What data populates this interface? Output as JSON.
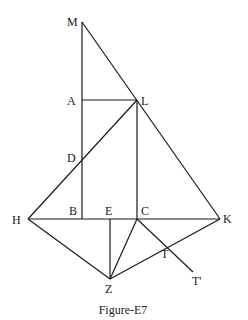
{
  "figure": {
    "caption": "Figure-E7",
    "points": {
      "M": {
        "x": 82,
        "y": 22,
        "label": "M"
      },
      "A": {
        "x": 82,
        "y": 100,
        "label": "A"
      },
      "L": {
        "x": 137,
        "y": 100,
        "label": "L"
      },
      "D": {
        "x": 82,
        "y": 155,
        "label": "D"
      },
      "H": {
        "x": 28,
        "y": 219,
        "label": "H"
      },
      "B": {
        "x": 82,
        "y": 219,
        "label": "B"
      },
      "E": {
        "x": 110,
        "y": 219,
        "label": "E"
      },
      "C": {
        "x": 137,
        "y": 219,
        "label": "C"
      },
      "K": {
        "x": 220,
        "y": 219,
        "label": "K"
      },
      "Z": {
        "x": 110,
        "y": 279,
        "label": "Z"
      },
      "T": {
        "x": 166,
        "y": 245,
        "label": "T"
      },
      "T2": {
        "x": 193,
        "y": 272,
        "label": "T'"
      }
    },
    "segments": [
      [
        "M",
        "B"
      ],
      [
        "M",
        "K"
      ],
      [
        "A",
        "L"
      ],
      [
        "L",
        "C"
      ],
      [
        "L",
        "H"
      ],
      [
        "H",
        "K"
      ],
      [
        "H",
        "Z"
      ],
      [
        "E",
        "Z"
      ],
      [
        "C",
        "Z"
      ],
      [
        "Z",
        "K"
      ],
      [
        "C",
        "T2"
      ]
    ]
  }
}
